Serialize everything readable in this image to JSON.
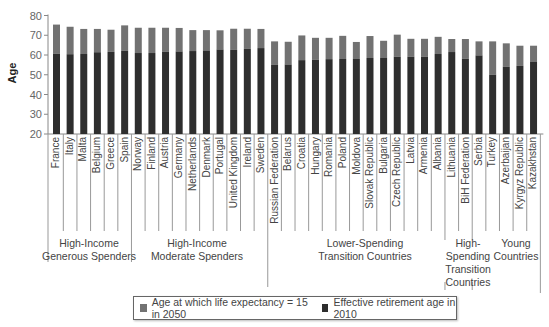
{
  "chart_data": {
    "type": "bar",
    "stacked": true,
    "title": "",
    "xlabel": "",
    "ylabel": "Age",
    "ylim": [
      20,
      80
    ],
    "yticks": [
      20,
      30,
      40,
      50,
      60,
      70,
      80
    ],
    "grid": false,
    "legend_position": "bottom",
    "categories": [
      "France",
      "Italy",
      "Malta",
      "Belgium",
      "Greece",
      "Spain",
      "Norway",
      "Finland",
      "Austria",
      "Germany",
      "Netherlands",
      "Denmark",
      "Portugal",
      "United Kingdom",
      "Ireland",
      "Sweden",
      "Russian Federation",
      "Belarus",
      "Croatia",
      "Hungary",
      "Romania",
      "Poland",
      "Moldova",
      "Slovak Republic",
      "Bulgaria",
      "Czech Republic",
      "Latvia",
      "Armenia",
      "Albania",
      "Lithuania",
      "BiH Federation",
      "Serbia",
      "Turkey",
      "Azerbaijan",
      "Kyrgyz Republic",
      "Kazakhstan"
    ],
    "series": [
      {
        "name": "Effective retirement age in 2010",
        "color": "#2e2e2e",
        "values": [
          60.6,
          60.4,
          60.5,
          61.4,
          61.6,
          62.1,
          61.0,
          61.0,
          61.6,
          61.8,
          62.0,
          62.3,
          62.8,
          62.6,
          63.1,
          63.5,
          55.0,
          55.2,
          57.4,
          57.6,
          57.9,
          58.0,
          58.0,
          58.5,
          58.5,
          59.1,
          59.1,
          59.1,
          60.5,
          61.5,
          58.1,
          59.8,
          50.0,
          54.0,
          54.5,
          56.7
        ]
      },
      {
        "name": "Age at which life expectancy = 15 in 2050",
        "color": "#727272",
        "values": [
          75.4,
          74.3,
          73.2,
          73.2,
          72.8,
          75.0,
          73.8,
          73.8,
          73.8,
          73.7,
          72.6,
          72.6,
          72.5,
          73.3,
          73.3,
          73.2,
          66.9,
          66.7,
          69.9,
          68.7,
          68.7,
          69.7,
          66.6,
          69.6,
          67.2,
          70.3,
          68.2,
          68.2,
          69.2,
          68.1,
          68.1,
          66.9,
          66.9,
          65.9,
          64.7,
          64.7
        ]
      }
    ],
    "groups": [
      {
        "label": "High-Income Generous Spenders",
        "lines": [
          "High-Income",
          "Generous Spenders"
        ],
        "start": 0,
        "end": 5
      },
      {
        "label": "High-Income Moderate Spenders",
        "lines": [
          "High-Income",
          "Moderate Spenders"
        ],
        "start": 6,
        "end": 15
      },
      {
        "label": "Lower-Spending Transition Countries",
        "lines": [
          "Lower-Spending",
          "Transition Countries"
        ],
        "start": 16,
        "end": 28
      },
      {
        "label": "High-Spending Transition Countries",
        "lines": [
          "High-",
          "Spending",
          "Transition",
          "Countries"
        ],
        "start": 29,
        "end": 30
      },
      {
        "label": "Young Countries",
        "lines": [
          "Young",
          "Countries"
        ],
        "start": 31,
        "end": 35
      }
    ]
  },
  "legend": {
    "items": [
      {
        "label": "Age at which life expectancy = 15 in 2050",
        "color": "#727272"
      },
      {
        "label": "Effective retirement age in 2010",
        "color": "#2e2e2e"
      }
    ]
  }
}
